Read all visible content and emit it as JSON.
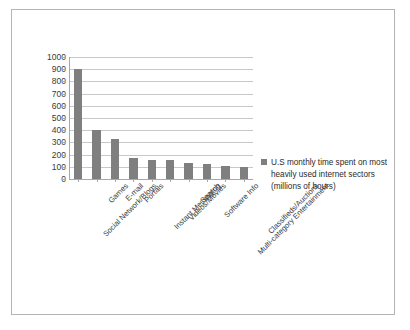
{
  "chart_data": {
    "type": "bar",
    "title": "",
    "subtitle": "",
    "xlabel": "",
    "ylabel": "",
    "ylim": [
      0,
      1000
    ],
    "ytick_step": 100,
    "yticks": [
      "0",
      "100",
      "200",
      "300",
      "400",
      "500",
      "600",
      "700",
      "800",
      "900",
      "1000"
    ],
    "grid": true,
    "legend_position": "right",
    "categories": [
      "Social Network/Blogs",
      "Games",
      "E-mail",
      "Portals",
      "Instant Messaging",
      "Videos/Movies",
      "Search",
      "Software Info",
      "Multi-category Entertainment",
      "Classifieds/Auctions"
    ],
    "series": [
      {
        "name": "U.S monthly time spent on most heavily used internet sectors (millions of hours)",
        "color": "#7f7f7f",
        "values": [
          900,
          405,
          325,
          172,
          155,
          152,
          133,
          125,
          105,
          100
        ]
      }
    ]
  },
  "legend": {
    "line1": "U.S monthly time spent on most",
    "line2": "heavily used internet sectors",
    "line3": "(millions of hours)",
    "swatch_color": "#7f7f7f"
  },
  "style": {
    "bar_color": "#7f7f7f",
    "grid_color": "#c8c8c8",
    "axis_color": "#a8a8a8",
    "border_color": "#b4b4b4",
    "background": "#ffffff",
    "text_color": "#3a3a3a"
  }
}
